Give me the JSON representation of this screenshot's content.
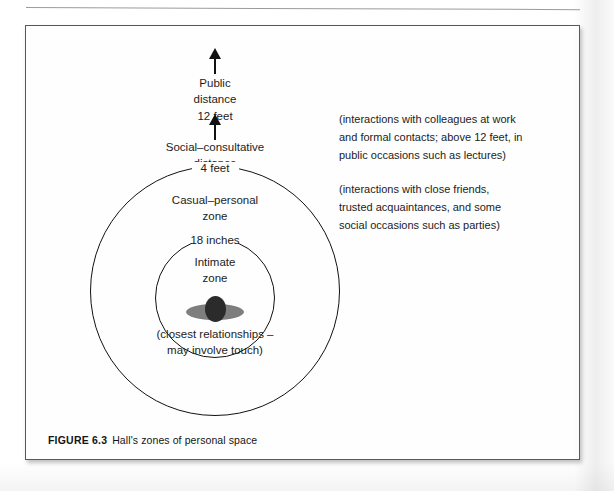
{
  "figure": {
    "caption_number": "FIGURE 6.3",
    "caption_text": "Hall's zones of personal space",
    "axis_labels": {
      "public": {
        "line1": "Public",
        "line2": "distance",
        "line3": "12 feet"
      },
      "social": {
        "line1": "Social–consultative",
        "line2": "distance",
        "line3": "4 feet"
      }
    },
    "ring_labels": {
      "outer_boundary": "4 feet",
      "outer_zone_line1": "Casual–personal",
      "outer_zone_line2": "zone",
      "inner_boundary": "18 inches",
      "inner_zone_line1": "Intimate",
      "inner_zone_line2": "zone",
      "inner_note_line1": "(closest relationships –",
      "inner_note_line2": "may involve touch)"
    },
    "notes": {
      "public_note": {
        "line1": "(interactions with colleagues at work",
        "line2": "and formal contacts; above 12 feet, in",
        "line3": "public occasions such as lectures)"
      },
      "social_note": {
        "line1": "(interactions with close friends,",
        "line2": "trusted acquaintances, and some",
        "line3": "social occasions such as parties)"
      }
    },
    "icons": {
      "arrow_public": "arrow-up-icon",
      "arrow_social": "arrow-up-icon",
      "person": "person-figure-icon"
    },
    "colors": {
      "ink": "#1c1c1c",
      "ring_stroke": "#111111",
      "head_fill": "#2b2b2b",
      "shoulders_fill": "#7e7e7e",
      "frame_border": "#55585c",
      "page_background": "#ffffff"
    }
  }
}
